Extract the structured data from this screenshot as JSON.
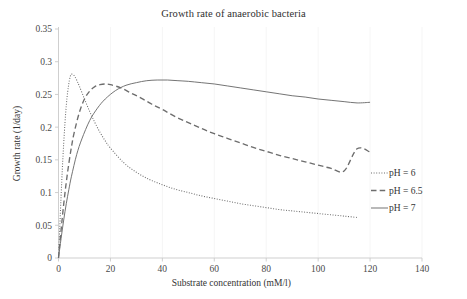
{
  "chart_data": {
    "type": "line",
    "title": "Growth rate of anaerobic bacteria",
    "xlabel": "Substrate concentration (mM/l)",
    "ylabel": "Growth rate (1/day)",
    "xlim": [
      0,
      140
    ],
    "ylim": [
      0,
      0.35
    ],
    "xticks": [
      0,
      20,
      40,
      60,
      80,
      100,
      120,
      140
    ],
    "yticks": [
      0,
      0.05,
      0.1,
      0.15,
      0.2,
      0.25,
      0.3,
      0.35
    ],
    "xtick_labels": [
      "0",
      "20",
      "40",
      "60",
      "80",
      "100",
      "120",
      "140"
    ],
    "ytick_labels": [
      "0",
      "0.05",
      "0.1",
      "0.15",
      "0.2",
      "0.25",
      "0.3",
      "0.35"
    ],
    "grid": false,
    "legend_position": "right",
    "series": [
      {
        "name": "pH = 6",
        "style": "dotted",
        "color": "#6d6d6d",
        "peak": {
          "x": 5,
          "y": 0.281
        },
        "x": [
          0,
          0.5,
          1,
          1.5,
          2,
          2.5,
          3,
          3.5,
          4,
          4.5,
          5,
          6,
          7,
          8,
          10,
          12,
          14,
          16,
          18,
          20,
          25,
          30,
          35,
          40,
          45,
          50,
          55,
          60,
          65,
          70,
          75,
          80,
          85,
          90,
          95,
          100,
          105,
          110,
          115,
          120
        ],
        "y": [
          0,
          0.048,
          0.095,
          0.138,
          0.175,
          0.207,
          0.233,
          0.253,
          0.267,
          0.277,
          0.281,
          0.279,
          0.272,
          0.263,
          0.243,
          0.224,
          0.207,
          0.192,
          0.179,
          0.168,
          0.146,
          0.131,
          0.12,
          0.112,
          0.105,
          0.1,
          0.095,
          0.091,
          0.087,
          0.083,
          0.08,
          0.077,
          0.074,
          0.072,
          0.07,
          0.068,
          0.066,
          0.064,
          0.062,
          0.1
        ]
      },
      {
        "name": "pH = 6.5",
        "style": "dashed",
        "color": "#6d6d6d",
        "peak": {
          "x": 18,
          "y": 0.266
        },
        "x": [
          0,
          1,
          2,
          3,
          4,
          5,
          6,
          8,
          10,
          12,
          14,
          16,
          18,
          20,
          24,
          28,
          32,
          36,
          40,
          45,
          50,
          55,
          60,
          65,
          70,
          75,
          80,
          85,
          90,
          95,
          100,
          105,
          110,
          115,
          120
        ],
        "y": [
          0,
          0.043,
          0.082,
          0.116,
          0.145,
          0.17,
          0.191,
          0.222,
          0.243,
          0.255,
          0.262,
          0.265,
          0.266,
          0.265,
          0.26,
          0.252,
          0.244,
          0.235,
          0.227,
          0.216,
          0.207,
          0.198,
          0.19,
          0.183,
          0.176,
          0.169,
          0.163,
          0.157,
          0.152,
          0.147,
          0.142,
          0.137,
          0.133,
          0.167,
          0.162
        ]
      },
      {
        "name": "pH = 7",
        "style": "solid",
        "color": "#8a8a8a",
        "peak": {
          "x": 42,
          "y": 0.272
        },
        "x": [
          0,
          1,
          2,
          3,
          4,
          5,
          7,
          9,
          12,
          15,
          18,
          22,
          26,
          30,
          34,
          38,
          42,
          46,
          50,
          55,
          60,
          65,
          70,
          75,
          80,
          85,
          90,
          95,
          100,
          105,
          110,
          115,
          120
        ],
        "y": [
          0,
          0.03,
          0.058,
          0.083,
          0.105,
          0.125,
          0.158,
          0.182,
          0.21,
          0.229,
          0.243,
          0.256,
          0.264,
          0.268,
          0.271,
          0.272,
          0.272,
          0.271,
          0.27,
          0.268,
          0.266,
          0.263,
          0.26,
          0.257,
          0.254,
          0.251,
          0.248,
          0.246,
          0.243,
          0.241,
          0.239,
          0.237,
          0.238
        ]
      }
    ],
    "legend": [
      {
        "label": "pH = 6",
        "style": "dotted"
      },
      {
        "label": "pH = 6.5",
        "style": "dashed"
      },
      {
        "label": "pH = 7",
        "style": "solid"
      }
    ]
  }
}
